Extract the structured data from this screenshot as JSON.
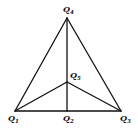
{
  "diagram": {
    "type": "triangle-with-interior-point",
    "nodes": [
      {
        "id": "Q1",
        "letter": "Q",
        "sub": "1",
        "x": 15,
        "y": 111,
        "lx": 8,
        "ly": 121
      },
      {
        "id": "Q2",
        "letter": "Q",
        "sub": "2",
        "x": 67,
        "y": 111,
        "lx": 63,
        "ly": 121
      },
      {
        "id": "Q3",
        "letter": "Q",
        "sub": "3",
        "x": 121,
        "y": 111,
        "lx": 120,
        "ly": 121
      },
      {
        "id": "Q4",
        "letter": "Q",
        "sub": "4",
        "x": 67,
        "y": 18,
        "lx": 63,
        "ly": 12
      },
      {
        "id": "Q5",
        "letter": "Q",
        "sub": "5",
        "x": 67,
        "y": 82,
        "lx": 70,
        "ly": 78
      }
    ],
    "edges": [
      [
        "Q1",
        "Q4"
      ],
      [
        "Q4",
        "Q3"
      ],
      [
        "Q1",
        "Q3"
      ],
      [
        "Q4",
        "Q2"
      ],
      [
        "Q1",
        "Q5"
      ],
      [
        "Q5",
        "Q3"
      ]
    ],
    "line_color": "#111111"
  }
}
